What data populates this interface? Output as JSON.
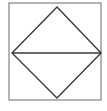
{
  "diagram": {
    "type": "geometric-figure",
    "frame": {
      "x": 9,
      "y": 3,
      "width": 92,
      "height": 97,
      "stroke": "#555555"
    },
    "diamond": {
      "vertices": {
        "top": [
          57,
          7
        ],
        "right": [
          101,
          53
        ],
        "bottom": [
          57,
          98
        ],
        "left": [
          12,
          53
        ]
      },
      "stroke": "#3a3a3a"
    },
    "horizontal_diagonal": {
      "from": [
        12,
        53
      ],
      "to": [
        101,
        53
      ],
      "stroke": "#3a3a3a"
    }
  },
  "caption": {
    "text": ""
  }
}
